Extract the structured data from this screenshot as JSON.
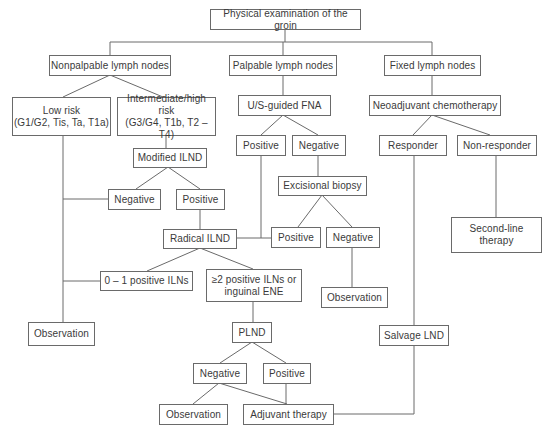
{
  "diagram": {
    "type": "flowchart",
    "nodes": {
      "root": "Physical examination of the groin",
      "nonpalpable": "Nonpalpable lymph nodes",
      "palpable": "Palpable lymph nodes",
      "fixed": "Fixed lymph nodes",
      "low_risk": "Low risk\n(G1/G2, Tis, Ta, T1a)",
      "intermediate_high_risk": "Intermediate/high risk\n(G3/G4, T1b, T2 – T4)",
      "us_guided_fna": "U/S-guided FNA",
      "neoadjuvant_chemo": "Neoadjuvant chemotherapy",
      "modified_ilnd": "Modified ILND",
      "fna_positive": "Positive",
      "fna_negative": "Negative",
      "responder": "Responder",
      "non_responder": "Non-responder",
      "excisional_biopsy": "Excisional biopsy",
      "milnd_negative": "Negative",
      "milnd_positive": "Positive",
      "radical_ilnd": "Radical ILND",
      "biopsy_positive": "Positive",
      "biopsy_negative": "Negative",
      "second_line_therapy": "Second-line\ntherapy",
      "zero_one_positive": "0 – 1 positive ILNs",
      "two_plus_positive": "≥2 positive ILNs or\ninguinal ENE",
      "observation_left": "Observation",
      "observation_mid": "Observation",
      "plnd": "PLND",
      "salvage_lnd": "Salvage LND",
      "plnd_negative": "Negative",
      "plnd_positive": "Positive",
      "observation_bottom": "Observation",
      "adjuvant_therapy": "Adjuvant therapy"
    },
    "edges": [
      [
        "root",
        "nonpalpable"
      ],
      [
        "root",
        "palpable"
      ],
      [
        "root",
        "fixed"
      ],
      [
        "nonpalpable",
        "low_risk"
      ],
      [
        "nonpalpable",
        "intermediate_high_risk"
      ],
      [
        "palpable",
        "us_guided_fna"
      ],
      [
        "fixed",
        "neoadjuvant_chemo"
      ],
      [
        "intermediate_high_risk",
        "modified_ilnd"
      ],
      [
        "us_guided_fna",
        "fna_positive"
      ],
      [
        "us_guided_fna",
        "fna_negative"
      ],
      [
        "neoadjuvant_chemo",
        "responder"
      ],
      [
        "neoadjuvant_chemo",
        "non_responder"
      ],
      [
        "fna_negative",
        "excisional_biopsy"
      ],
      [
        "modified_ilnd",
        "milnd_negative"
      ],
      [
        "modified_ilnd",
        "milnd_positive"
      ],
      [
        "milnd_positive",
        "radical_ilnd"
      ],
      [
        "fna_positive",
        "radical_ilnd"
      ],
      [
        "excisional_biopsy",
        "biopsy_positive"
      ],
      [
        "excisional_biopsy",
        "biopsy_negative"
      ],
      [
        "biopsy_positive",
        "radical_ilnd"
      ],
      [
        "biopsy_negative",
        "observation_mid"
      ],
      [
        "non_responder",
        "second_line_therapy"
      ],
      [
        "radical_ilnd",
        "zero_one_positive"
      ],
      [
        "radical_ilnd",
        "two_plus_positive"
      ],
      [
        "low_risk",
        "observation_left"
      ],
      [
        "milnd_negative",
        "observation_left"
      ],
      [
        "zero_one_positive",
        "observation_left"
      ],
      [
        "two_plus_positive",
        "plnd"
      ],
      [
        "responder",
        "salvage_lnd"
      ],
      [
        "plnd",
        "plnd_negative"
      ],
      [
        "plnd",
        "plnd_positive"
      ],
      [
        "plnd_negative",
        "observation_bottom"
      ],
      [
        "plnd_negative",
        "adjuvant_therapy"
      ],
      [
        "plnd_positive",
        "adjuvant_therapy"
      ],
      [
        "salvage_lnd",
        "adjuvant_therapy"
      ]
    ]
  }
}
